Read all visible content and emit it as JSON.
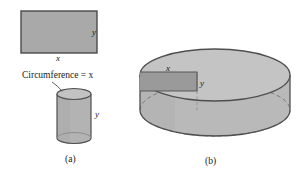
{
  "figure": {
    "caption_a": "(a)",
    "caption_b": "(b)",
    "circumference_label": "Circumference = x",
    "rect_width_label": "x",
    "rect_height_label": "y",
    "small_cylinder_height_label": "y",
    "big_rect_width_label": "x",
    "big_rect_height_label": "y",
    "colors": {
      "rect_fill": "#a9a9a9",
      "rect_stroke": "#4a4a4a",
      "cylinder_body": "#b5b5b5",
      "cylinder_top": "#bfbfbf",
      "cylinder_stroke": "#555555",
      "inscribed_rect_fill": "#9a9a9a",
      "hidden_edge": "#7d7d7d",
      "text": "#1a1a1a"
    }
  }
}
